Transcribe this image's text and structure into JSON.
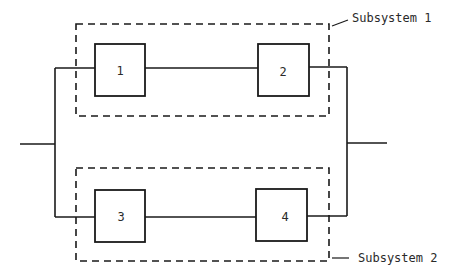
{
  "diagram": {
    "type": "reliability-block-diagram",
    "blocks": [
      {
        "id": "1",
        "label": "1"
      },
      {
        "id": "2",
        "label": "2"
      },
      {
        "id": "3",
        "label": "3"
      },
      {
        "id": "4",
        "label": "4"
      }
    ],
    "subsystems": [
      {
        "label": "Subsystem 1",
        "blocks": [
          "1",
          "2"
        ]
      },
      {
        "label": "Subsystem 2",
        "blocks": [
          "3",
          "4"
        ]
      }
    ],
    "colors": {
      "line": "#1a1a1a",
      "text": "#2a2a2a",
      "background": "#ffffff"
    }
  }
}
